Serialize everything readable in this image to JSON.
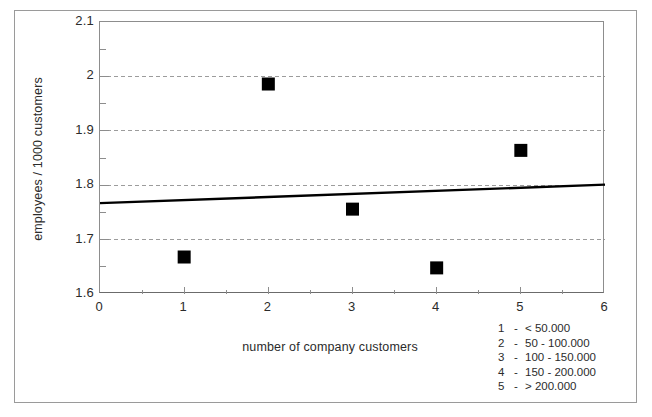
{
  "chart_data": {
    "type": "scatter",
    "title": "",
    "xlabel": "number of company customers",
    "ylabel": "employees / 1000 customers",
    "xlim": [
      0,
      6
    ],
    "ylim": [
      1.6,
      2.1
    ],
    "xticks": [
      "0",
      "1",
      "2",
      "3",
      "4",
      "5",
      "6"
    ],
    "xtick_values": [
      0,
      1,
      2,
      3,
      4,
      5,
      6
    ],
    "yticks": [
      "1.6",
      "1.7",
      "1.8",
      "1.9",
      "2",
      "2.1"
    ],
    "ytick_values": [
      1.6,
      1.7,
      1.8,
      1.9,
      2.0,
      2.1
    ],
    "x_minor_ticks": [
      0.5,
      1.5,
      2.5,
      3.5,
      4.5,
      5.5
    ],
    "y_minor_ticks": [
      1.65,
      1.75,
      1.85,
      1.95,
      2.05
    ],
    "grid": "horizontal-dashed-at-major-y",
    "grid_values": [
      1.7,
      1.8,
      1.9,
      2.0
    ],
    "marker": "filled-square",
    "marker_color": "#000000",
    "x": [
      1,
      2,
      3,
      4,
      5
    ],
    "y": [
      1.668,
      1.986,
      1.756,
      1.648,
      1.864
    ],
    "series": [
      {
        "name": "employees per 1000 customers",
        "points": [
          {
            "x": 1,
            "y": 1.668
          },
          {
            "x": 2,
            "y": 1.986
          },
          {
            "x": 3,
            "y": 1.756
          },
          {
            "x": 4,
            "y": 1.648
          },
          {
            "x": 5,
            "y": 1.864
          }
        ]
      },
      {
        "name": "trendline",
        "type": "line",
        "endpoints": [
          {
            "x": 0,
            "y": 1.767
          },
          {
            "x": 6,
            "y": 1.801
          }
        ],
        "color": "#000000"
      }
    ],
    "legend_position": "below-right-outside-plot",
    "legend": [
      {
        "key": "1",
        "dash": "-",
        "label": "< 50.000"
      },
      {
        "key": "2",
        "dash": "-",
        "label": "50 - 100.000"
      },
      {
        "key": "3",
        "dash": "-",
        "label": "100 - 150.000"
      },
      {
        "key": "4",
        "dash": "-",
        "label": "150 - 200.000"
      },
      {
        "key": "5",
        "dash": "-",
        "label": "> 200.000"
      }
    ]
  },
  "axes": {
    "x_title": "number of company customers",
    "y_title": "employees / 1000 customers"
  },
  "colors": {
    "marker": "#000000",
    "trendline": "#000000",
    "gridline": "#9c9c9c",
    "axis": "#8d8d8d",
    "frame": "#9a9a9a",
    "text": "#2b2b2b",
    "background": "#ffffff"
  }
}
